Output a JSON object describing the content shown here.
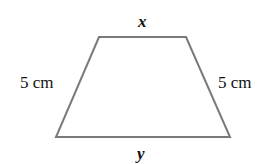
{
  "figure": {
    "shape": "isosceles-trapezoid",
    "stroke_color": "#7a7a7a",
    "labels": {
      "top": "x",
      "bottom": "y",
      "left": "5 cm",
      "right": "5 cm"
    }
  }
}
